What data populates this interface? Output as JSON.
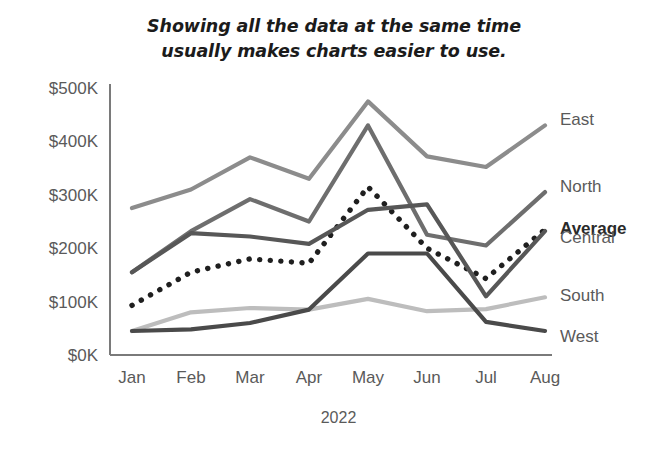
{
  "title": {
    "line1": "Showing all the data at the same time",
    "line2": "usually makes charts easier to use."
  },
  "axis": {
    "x_title": "2022",
    "y_ticks": [
      "$500K",
      "$400K",
      "$300K",
      "$200K",
      "$100K",
      "$0K"
    ],
    "x_ticks": [
      "Jan",
      "Feb",
      "Mar",
      "Apr",
      "May",
      "Jun",
      "Jul",
      "Aug"
    ]
  },
  "series_labels": {
    "east": "East",
    "north": "North",
    "average": "Average",
    "central": "Central",
    "south": "South",
    "west": "West"
  },
  "colors": {
    "east": "#8c8c8c",
    "north": "#6e6e6e",
    "average": "#1f1f1f",
    "central": "#575757",
    "south": "#bdbdbd",
    "west": "#4a4a4a",
    "axis": "#7a7a7a",
    "text": "#5a5a5a",
    "title": "#1b1b1b",
    "background": "#ffffff"
  },
  "chart_data": {
    "type": "line",
    "title": "Showing all the data at the same time usually makes charts easier to use.",
    "xlabel": "2022",
    "ylabel": "",
    "categories": [
      "Jan",
      "Feb",
      "Mar",
      "Apr",
      "May",
      "Jun",
      "Jul",
      "Aug"
    ],
    "ylim": [
      0,
      500000
    ],
    "ytick_values": [
      0,
      100000,
      200000,
      300000,
      400000,
      500000
    ],
    "ytick_labels": [
      "$0K",
      "$100K",
      "$200K",
      "$300K",
      "$400K",
      "$500K"
    ],
    "grid": false,
    "legend": "right-inline-labels",
    "series": [
      {
        "name": "East",
        "color": "#8c8c8c",
        "style": "solid",
        "values": [
          275000,
          310000,
          370000,
          330000,
          475000,
          372000,
          352000,
          430000
        ]
      },
      {
        "name": "North",
        "color": "#6e6e6e",
        "style": "solid",
        "values": [
          155000,
          232000,
          292000,
          250000,
          430000,
          225000,
          205000,
          305000
        ]
      },
      {
        "name": "Average",
        "color": "#1f1f1f",
        "style": "dotted",
        "values": [
          93000,
          155000,
          180000,
          172000,
          315000,
          200000,
          143000,
          235000
        ]
      },
      {
        "name": "Central",
        "color": "#575757",
        "style": "solid",
        "values": [
          155000,
          228000,
          222000,
          208000,
          272000,
          282000,
          110000,
          232000
        ]
      },
      {
        "name": "South",
        "color": "#bdbdbd",
        "style": "solid",
        "values": [
          45000,
          80000,
          88000,
          85000,
          105000,
          82000,
          86000,
          108000
        ]
      },
      {
        "name": "West",
        "color": "#4a4a4a",
        "style": "solid",
        "values": [
          45000,
          48000,
          60000,
          85000,
          190000,
          190000,
          62000,
          45000
        ]
      }
    ]
  }
}
